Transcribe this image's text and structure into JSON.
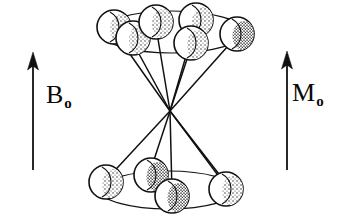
{
  "figure": {
    "background_color": "#ffffff",
    "ink_color": "#111111",
    "width": 342,
    "height": 223
  },
  "labels": {
    "field": {
      "symbol": "B",
      "subscript": "o",
      "full": "Bo"
    },
    "magnetization": {
      "symbol": "M",
      "subscript": "o",
      "full": "Mo"
    }
  },
  "arrows": {
    "field_arrow": {
      "name": "B0 field arrow",
      "direction": "up",
      "x": 33,
      "y_tail": 170,
      "y_tip": 53,
      "shaft_width": 1.6,
      "head_width": 11,
      "head_length": 15,
      "color": "#111111"
    },
    "magnetization_arrow": {
      "name": "M0 magnetization arrow",
      "direction": "up",
      "x": 287,
      "y_tail": 170,
      "y_tip": 52,
      "shaft_width": 1.6,
      "head_width": 11,
      "head_length": 15,
      "color": "#111111"
    }
  },
  "cone": {
    "apex": {
      "x": 170,
      "y": 111
    },
    "upper_ring": {
      "name": "upper precession ring",
      "cx": 172,
      "cy": 32,
      "rx": 72,
      "ry": 21,
      "stroke_width": 1.2
    },
    "lower_ring": {
      "name": "lower precession ring",
      "cx": 168,
      "cy": 190,
      "rx": 68,
      "ry": 19,
      "stroke_width": 1.2
    }
  },
  "spheres": {
    "radius": 17,
    "stroke_width": 1.6,
    "fill": "#ffffff",
    "stipple_color": "#2a2a2a",
    "upper": [
      {
        "id": "u1",
        "cx": 114,
        "cy": 27,
        "r": 17,
        "phase_deg": 180
      },
      {
        "id": "u2",
        "cx": 133,
        "cy": 38,
        "r": 17,
        "phase_deg": 215
      },
      {
        "id": "u3",
        "cx": 156,
        "cy": 22,
        "r": 17,
        "phase_deg": 110
      },
      {
        "id": "u4",
        "cx": 196,
        "cy": 20,
        "r": 17,
        "phase_deg": 70
      },
      {
        "id": "u5",
        "cx": 191,
        "cy": 43,
        "r": 17,
        "phase_deg": 300
      },
      {
        "id": "u6",
        "cx": 237,
        "cy": 34,
        "r": 17,
        "phase_deg": 0
      }
    ],
    "lower": [
      {
        "id": "l1",
        "cx": 106,
        "cy": 182,
        "r": 17,
        "phase_deg": 180
      },
      {
        "id": "l2",
        "cx": 151,
        "cy": 175,
        "r": 17,
        "phase_deg": 120
      },
      {
        "id": "l3",
        "cx": 172,
        "cy": 196,
        "r": 17,
        "phase_deg": 260
      },
      {
        "id": "l4",
        "cx": 226,
        "cy": 189,
        "r": 17,
        "phase_deg": 10
      }
    ]
  },
  "generatrix_lines": {
    "name": "cone generatrix lines from apex to spheres",
    "stroke_width": 1.5,
    "count_upper": 6,
    "count_lower": 4
  }
}
